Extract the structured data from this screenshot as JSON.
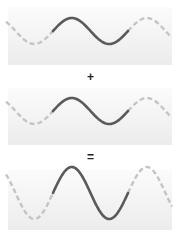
{
  "diagram": {
    "operators": {
      "plus": "+",
      "equals": "="
    },
    "colors": {
      "solid_wave": "#5a5a5a",
      "dashed_wave": "#c4c4c4",
      "panel_top": "#fbfbfb",
      "panel_bottom": "#ececec"
    },
    "waves": [
      {
        "name": "wave-1",
        "relative_amplitude": 1,
        "periods_shown": 2,
        "highlighted_periods": 1
      },
      {
        "name": "wave-2",
        "relative_amplitude": 1,
        "periods_shown": 2,
        "highlighted_periods": 1
      },
      {
        "name": "resultant-wave",
        "relative_amplitude": 2,
        "periods_shown": 2,
        "highlighted_periods": 1
      }
    ]
  }
}
